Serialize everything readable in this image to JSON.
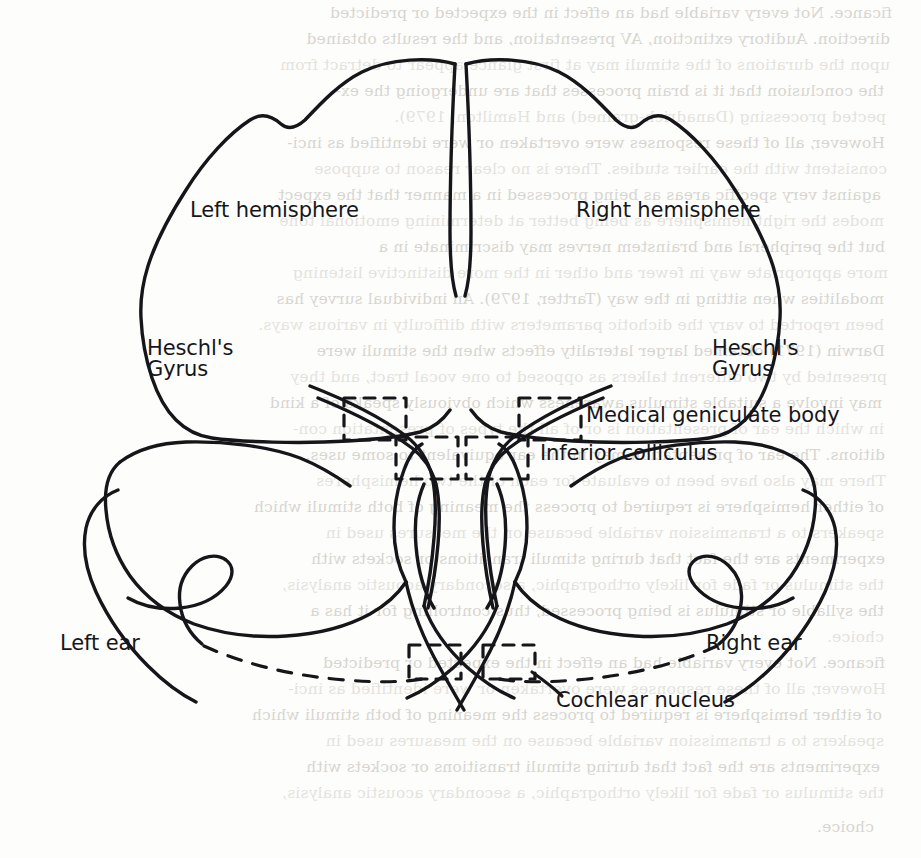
{
  "figure": {
    "type": "anatomical-diagram",
    "ink_color": "#16161a",
    "paper_color": "#fdfdfb",
    "labels": {
      "left_hemisphere": "Left hemisphere",
      "right_hemisphere": "Right hemisphere",
      "heschls_gyrus_left_line1": "Heschl's",
      "heschls_gyrus_left_line2": "Gyrus",
      "heschls_gyrus_right_line1": "Heschl's",
      "heschls_gyrus_right_line2": "Gyrus",
      "medial_geniculate_body": "Medical geniculate body",
      "inferior_colliculus": "Inferior colliculus",
      "cochlear_nucleus": "Cochlear nucleus",
      "left_ear": "Left ear",
      "right_ear": "Right ear"
    },
    "annotation_boxes": [
      {
        "name": "medial-geniculate-body-left",
        "style": "dashed-rectangle"
      },
      {
        "name": "inferior-colliculus-left",
        "style": "dashed-rectangle"
      },
      {
        "name": "medial-geniculate-body-right",
        "style": "dashed-rectangle"
      },
      {
        "name": "inferior-colliculus-right",
        "style": "dashed-rectangle"
      },
      {
        "name": "cochlear-nucleus-left",
        "style": "dashed-rectangle"
      },
      {
        "name": "cochlear-nucleus-right",
        "style": "dashed-rectangle"
      }
    ]
  },
  "background_text": {
    "note": "faint mirrored bleed-through from reverse of scanned page; largely illegible",
    "lines": [
      "ficance. Not every variable had an effect in the expected or predicted",
      "direction. Auditory extinction, AV presentation, and the results obtained",
      "upon the durations of the stimuli may at first glance appear to detract from",
      "the conclusion that it is brain processes that are undergoing the ex-",
      "pected processing (Danadrich-grained) and Hamilton, 1979).",
      "However, all of these responses were overtaken or were identified as inci-",
      "consistent with the earlier studies. There is no clear reason to suppose",
      "against very specific areas as being processed in a manner that the expect",
      "modes the right hemisphere as being better at determining emotional tone",
      "but the peripheral and brainstem nerves may discriminate in a",
      "more appropriate way in fewer and other in the more distinctive listening",
      "modalities when sitting in the way (Tartter, 1979). An individual survey has",
      "been reported to vary the dichotic parameters with difficulty in various ways.",
      "Darwin (1971) obtained larger laterality effects when the stimuli were",
      "presented by two different talkers as opposed to one vocal tract, and they",
      "may involve a suitable stimulus awareness which obviously speaks of a kind",
      "in which the ear of presentation is or of all the types of presentation con-",
      "ditions. The ear of presentation may in the ear equivalent to some uses.",
      "There may also have been to evaluate for each of the two hemispheres",
      "of either hemisphere is required to process the meaning of both stimuli which",
      "speakers to a transmission variable because on the measures used in",
      "experiments are the fact that during stimuli transitions or sockets with",
      "the stimulus or fade for likely orthographic, a secondary acoustic analysis,",
      "the syllable or stimulus is being processed, thus controlling for it has a",
      "choice.",
      "Thus research with dichotic and categorical ear differences also pro-"
    ]
  }
}
